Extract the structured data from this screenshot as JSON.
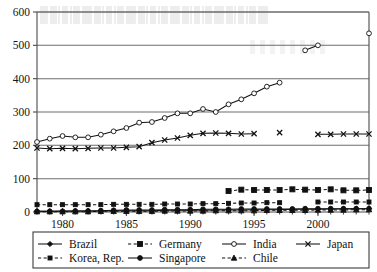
{
  "chart_data": {
    "type": "line",
    "title": "",
    "subtitle": "",
    "xlabel": "",
    "ylabel": "",
    "xlim": [
      1978,
      2004
    ],
    "ylim": [
      0,
      600
    ],
    "ytick_labels": [
      "0",
      "100",
      "200",
      "300",
      "400",
      "500",
      "600"
    ],
    "yticks": [
      0,
      100,
      200,
      300,
      400,
      500,
      600
    ],
    "xtick_labels": [
      "1980",
      "1985",
      "1990",
      "1995",
      "2000"
    ],
    "xticks": [
      1980,
      1985,
      1990,
      1995,
      2000
    ],
    "grid": "horizontal",
    "legend_position": "bottom",
    "legend_columns": 4,
    "x": [
      1978,
      1979,
      1980,
      1981,
      1982,
      1983,
      1984,
      1985,
      1986,
      1987,
      1988,
      1989,
      1990,
      1991,
      1992,
      1993,
      1994,
      1995,
      1996,
      1997,
      1998,
      1999,
      2000,
      2001,
      2002,
      2003,
      2004
    ],
    "series": [
      {
        "name": "Brazil",
        "marker": "filled-diamond",
        "line_style": "solid",
        "values": [
          2,
          2,
          3,
          3,
          3,
          3,
          4,
          4,
          4,
          4,
          5,
          5,
          5,
          5,
          6,
          6,
          6,
          7,
          7,
          7,
          8,
          8,
          8,
          9,
          9,
          10,
          10
        ]
      },
      {
        "name": "Germany",
        "marker": "filled-square",
        "line_style": "dashed",
        "values": [
          null,
          null,
          null,
          null,
          null,
          null,
          null,
          null,
          null,
          null,
          null,
          null,
          null,
          null,
          null,
          63,
          67,
          66,
          66,
          66,
          68,
          67,
          66,
          68,
          65,
          65,
          66
        ]
      },
      {
        "name": "India",
        "marker": "open-circle",
        "line_style": "solid",
        "values": [
          210,
          220,
          228,
          224,
          224,
          232,
          242,
          252,
          268,
          270,
          282,
          296,
          296,
          309,
          300,
          323,
          338,
          356,
          376,
          388,
          null,
          485,
          500,
          null,
          null,
          null,
          536
        ]
      },
      {
        "name": "Japan",
        "marker": "x-cross",
        "line_style": "solid",
        "values": [
          192,
          190,
          191,
          190,
          191,
          192,
          192,
          194,
          196,
          208,
          216,
          222,
          230,
          236,
          237,
          236,
          234,
          235,
          null,
          238,
          null,
          null,
          233,
          233,
          234,
          234,
          234
        ]
      },
      {
        "name": "Korea, Rep.",
        "marker": "small-filled-square",
        "line_style": "dashed",
        "values": [
          22,
          22,
          22,
          22,
          22,
          22,
          23,
          23,
          23,
          23,
          24,
          24,
          24,
          25,
          25,
          26,
          27,
          27,
          28,
          28,
          null,
          null,
          30,
          30,
          30,
          30,
          30
        ]
      },
      {
        "name": "Singapore",
        "marker": "filled-circle",
        "line_style": "solid",
        "values": [
          2,
          2,
          2,
          3,
          3,
          4,
          5,
          6,
          6,
          6,
          7,
          7,
          7,
          8,
          8,
          8,
          9,
          9,
          9,
          9,
          9,
          10,
          10,
          10,
          10,
          10,
          10
        ]
      },
      {
        "name": "Chile",
        "marker": "filled-triangle",
        "line_style": "dashed",
        "values": [
          1,
          1,
          1,
          1,
          1,
          2,
          2,
          2,
          2,
          2,
          3,
          3,
          3,
          3,
          4,
          4,
          4,
          4,
          5,
          5,
          5,
          5,
          6,
          6,
          6,
          7,
          7
        ]
      }
    ],
    "colors": {
      "axis": "#4a4a4a",
      "grid": "#6d6d6d",
      "series": "#111111",
      "background": "#ffffff"
    }
  },
  "legend": {
    "items": [
      {
        "label": "Brazil"
      },
      {
        "label": "Germany"
      },
      {
        "label": "India"
      },
      {
        "label": "Japan"
      },
      {
        "label": "Korea, Rep."
      },
      {
        "label": "Singapore"
      },
      {
        "label": "Chile"
      }
    ]
  }
}
